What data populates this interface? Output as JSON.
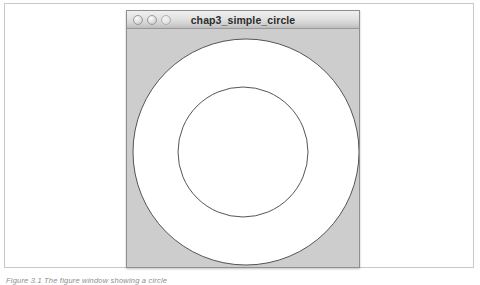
{
  "figure": {
    "caption": "Figure 3.1 The figure window showing a circle",
    "frame_border_color": "#c9c9c9",
    "background_color": "#ffffff"
  },
  "window": {
    "title": "chap3_simple_circle",
    "titlebar_color": "#e2e2e2",
    "border_color": "#8f8f8f",
    "canvas_color": "#cdcdcd",
    "controls": [
      {
        "name": "close",
        "label": ""
      },
      {
        "name": "minimize",
        "label": ""
      },
      {
        "name": "zoom",
        "label": ""
      }
    ]
  },
  "chart_data": {
    "type": "scatter",
    "title": "chap3_simple_circle",
    "xlabel": "",
    "ylabel": "",
    "background": "#cdcdcd",
    "shapes": [
      {
        "kind": "circle",
        "name": "outer-circle",
        "cx": 119,
        "cy": 123,
        "r": 113,
        "fill": "#ffffff",
        "stroke": "#555555",
        "stroke_width": 1
      },
      {
        "kind": "circle",
        "name": "inner-circle",
        "cx": 116,
        "cy": 123,
        "r": 65,
        "fill": "#ffffff",
        "stroke": "#555555",
        "stroke_width": 1
      }
    ]
  }
}
